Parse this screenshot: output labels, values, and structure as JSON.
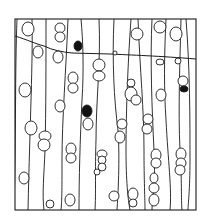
{
  "figure": {
    "type": "line-drawing",
    "colors": {
      "ink": "#1a1a1a",
      "background": "#ffffff",
      "filled_cell": "#111111"
    },
    "frame": {
      "x": 15,
      "y": 19,
      "width": 181,
      "height": 191
    },
    "ring_boundary": "M15,36 C28,40 36,44 44,46 C52,50 62,52 72,53 L110,54 C130,55 160,56 196,59",
    "walls": [
      "M17,19 C15,70 16,140 14,210",
      "M32,19 C33,60 30,120 28,210",
      "M46,19 C46,60 46,110 45,150 C44,175 42,195 44,210",
      "M68,19 C66,70 62,120 62,160 C62,185 62,200 61,210",
      "M81,19 C83,40 84,70 82,100 C80,140 79,180 79,210",
      "M99,19 C101,60 96,100 96,140 C95,170 96,195 95,210",
      "M114,19 C112,60 114,100 118,130 C120,160 118,195 117,210",
      "M131,19 C128,60 126,110 126,150 C126,180 128,200 130,210",
      "M138,19 C140,70 144,110 144,150 C144,180 145,200 145,210",
      "M152,19 C150,60 152,110 154,150 C156,180 152,200 152,210",
      "M166,19 C164,60 164,90 166,120 C168,160 172,190 170,210",
      "M181,19 C180,60 178,110 180,150 C182,180 181,200 182,210",
      "M186,19 C190,70 190,120 190,160 C190,190 188,205 188,210"
    ],
    "cells": [
      {
        "cx": 28,
        "cy": 29,
        "rx": 6,
        "ry": 7,
        "filled": false
      },
      {
        "cx": 60,
        "cy": 28,
        "rx": 5,
        "ry": 5,
        "filled": false
      },
      {
        "cx": 60,
        "cy": 37,
        "rx": 5,
        "ry": 5,
        "filled": false
      },
      {
        "cx": 38,
        "cy": 52,
        "rx": 5,
        "ry": 6,
        "filled": false
      },
      {
        "cx": 58,
        "cy": 57,
        "rx": 5,
        "ry": 6,
        "filled": false
      },
      {
        "cx": 78,
        "cy": 46,
        "rx": 4,
        "ry": 5,
        "filled": true
      },
      {
        "cx": 115,
        "cy": 53,
        "rx": 2,
        "ry": 2,
        "filled": false
      },
      {
        "cx": 137,
        "cy": 34,
        "rx": 6,
        "ry": 6,
        "filled": false
      },
      {
        "cx": 160,
        "cy": 27,
        "rx": 6,
        "ry": 6,
        "filled": false
      },
      {
        "cx": 176,
        "cy": 34,
        "rx": 6,
        "ry": 7,
        "filled": false
      },
      {
        "cx": 160,
        "cy": 62,
        "rx": 4,
        "ry": 3,
        "filled": false
      },
      {
        "cx": 178,
        "cy": 61,
        "rx": 3,
        "ry": 3,
        "filled": false
      },
      {
        "cx": 99,
        "cy": 65,
        "rx": 6,
        "ry": 6,
        "filled": false
      },
      {
        "cx": 99,
        "cy": 76,
        "rx": 6,
        "ry": 5,
        "filled": false
      },
      {
        "cx": 73,
        "cy": 78,
        "rx": 5,
        "ry": 6,
        "filled": false
      },
      {
        "cx": 73,
        "cy": 88,
        "rx": 5,
        "ry": 5,
        "filled": false
      },
      {
        "cx": 131,
        "cy": 83,
        "rx": 4,
        "ry": 4,
        "filled": false
      },
      {
        "cx": 131,
        "cy": 94,
        "rx": 6,
        "ry": 7,
        "filled": false
      },
      {
        "cx": 136,
        "cy": 100,
        "rx": 5,
        "ry": 5,
        "filled": false
      },
      {
        "cx": 183,
        "cy": 81,
        "rx": 5,
        "ry": 5,
        "filled": false
      },
      {
        "cx": 184,
        "cy": 89,
        "rx": 4,
        "ry": 3,
        "filled": true
      },
      {
        "cx": 25,
        "cy": 90,
        "rx": 6,
        "ry": 7,
        "filled": false
      },
      {
        "cx": 60,
        "cy": 106,
        "rx": 5,
        "ry": 6,
        "filled": false
      },
      {
        "cx": 87,
        "cy": 111,
        "rx": 5,
        "ry": 6,
        "filled": true
      },
      {
        "cx": 161,
        "cy": 95,
        "rx": 5,
        "ry": 6,
        "filled": false
      },
      {
        "cx": 3,
        "cy": 105,
        "rx": 3,
        "ry": 5,
        "filled": false
      },
      {
        "cx": 31,
        "cy": 128,
        "rx": 6,
        "ry": 7,
        "filled": false
      },
      {
        "cx": 45,
        "cy": 136,
        "rx": 6,
        "ry": 5,
        "filled": false
      },
      {
        "cx": 44,
        "cy": 145,
        "rx": 6,
        "ry": 6,
        "filled": false
      },
      {
        "cx": 71,
        "cy": 149,
        "rx": 5,
        "ry": 6,
        "filled": false
      },
      {
        "cx": 71,
        "cy": 158,
        "rx": 5,
        "ry": 5,
        "filled": false
      },
      {
        "cx": 88,
        "cy": 124,
        "rx": 5,
        "ry": 6,
        "filled": false
      },
      {
        "cx": 102,
        "cy": 154,
        "rx": 5,
        "ry": 4,
        "filled": false
      },
      {
        "cx": 102,
        "cy": 160,
        "rx": 4,
        "ry": 4,
        "filled": false
      },
      {
        "cx": 102,
        "cy": 167,
        "rx": 4,
        "ry": 4,
        "filled": false
      },
      {
        "cx": 120,
        "cy": 137,
        "rx": 5,
        "ry": 6,
        "filled": false
      },
      {
        "cx": 122,
        "cy": 124,
        "rx": 5,
        "ry": 5,
        "filled": false
      },
      {
        "cx": 148,
        "cy": 119,
        "rx": 5,
        "ry": 5,
        "filled": false
      },
      {
        "cx": 147,
        "cy": 129,
        "rx": 5,
        "ry": 5,
        "filled": false
      },
      {
        "cx": 156,
        "cy": 155,
        "rx": 5,
        "ry": 6,
        "filled": false
      },
      {
        "cx": 156,
        "cy": 163,
        "rx": 5,
        "ry": 5,
        "filled": false
      },
      {
        "cx": 181,
        "cy": 154,
        "rx": 5,
        "ry": 6,
        "filled": false
      },
      {
        "cx": 181,
        "cy": 163,
        "rx": 5,
        "ry": 5,
        "filled": false
      },
      {
        "cx": 24,
        "cy": 178,
        "rx": 5,
        "ry": 6,
        "filled": false
      },
      {
        "cx": 114,
        "cy": 196,
        "rx": 5,
        "ry": 5,
        "filled": false
      },
      {
        "cx": 133,
        "cy": 194,
        "rx": 5,
        "ry": 6,
        "filled": false
      },
      {
        "cx": 133,
        "cy": 203,
        "rx": 4,
        "ry": 4,
        "filled": false
      },
      {
        "cx": 154,
        "cy": 178,
        "rx": 4,
        "ry": 5,
        "filled": false
      },
      {
        "cx": 154,
        "cy": 188,
        "rx": 5,
        "ry": 5,
        "filled": false
      },
      {
        "cx": 154,
        "cy": 200,
        "rx": 5,
        "ry": 6,
        "filled": false
      },
      {
        "cx": 50,
        "cy": 204,
        "rx": 4,
        "ry": 4,
        "filled": false
      },
      {
        "cx": 70,
        "cy": 200,
        "rx": 5,
        "ry": 6,
        "filled": false
      },
      {
        "cx": 180,
        "cy": 170,
        "rx": 5,
        "ry": 5,
        "filled": false
      },
      {
        "cx": 97,
        "cy": 172,
        "rx": 3,
        "ry": 3,
        "filled": false
      }
    ]
  }
}
